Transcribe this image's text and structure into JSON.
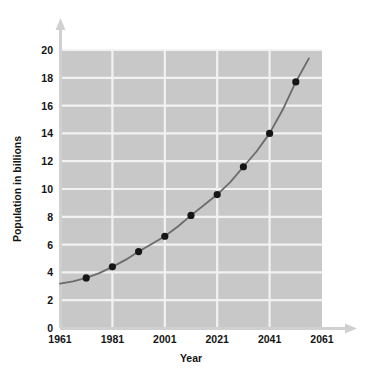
{
  "figure": {
    "corner_mark": "",
    "plot_background_color": "#c8c8c8",
    "grid_color": "#f2f2f2",
    "axis_color": "#d0d0d0",
    "curve_color": "#6b6b6b",
    "marker_color": "#161616"
  },
  "chart_data": {
    "type": "scatter",
    "title": "",
    "xlabel": "Year",
    "ylabel": "Population in billions",
    "xlim": [
      1961,
      2061
    ],
    "ylim": [
      0,
      20
    ],
    "xticks": [
      1961,
      1981,
      2001,
      2021,
      2041,
      2061
    ],
    "xtick_labels": [
      "1961",
      "1981",
      "2001",
      "2021",
      "2041",
      "2061"
    ],
    "yticks": [
      0,
      2,
      4,
      6,
      8,
      10,
      12,
      14,
      16,
      18,
      20
    ],
    "ytick_labels": [
      "0",
      "2",
      "4",
      "6",
      "8",
      "10",
      "12",
      "14",
      "16",
      "18",
      "20"
    ],
    "grid": true,
    "grid_x_values": [
      1981,
      2001,
      2021,
      2041
    ],
    "grid_y_values": [
      2,
      4,
      6,
      8,
      10,
      12,
      14,
      16,
      18,
      20
    ],
    "legend": null,
    "x": [
      1971,
      1981,
      1991,
      2001,
      2011,
      2021,
      2031,
      2041,
      2051
    ],
    "values": [
      3.6,
      4.4,
      5.5,
      6.6,
      8.1,
      9.6,
      11.6,
      14.0,
      17.7
    ],
    "series": [
      {
        "name": "Population in billions",
        "x": [
          1971,
          1981,
          1991,
          2001,
          2011,
          2021,
          2031,
          2041,
          2051
        ],
        "values": [
          3.6,
          4.4,
          5.5,
          6.6,
          8.1,
          9.6,
          11.6,
          14.0,
          17.7
        ],
        "marker": "circle",
        "line": "smooth-fit"
      }
    ],
    "fit_curve_x": [
      1961,
      1966,
      1971,
      1976,
      1981,
      1986,
      1991,
      1996,
      2001,
      2006,
      2011,
      2016,
      2021,
      2026,
      2031,
      2036,
      2041,
      2046,
      2051,
      2056
    ],
    "fit_curve_values": [
      3.2,
      3.35,
      3.6,
      3.95,
      4.4,
      4.9,
      5.5,
      6.05,
      6.6,
      7.3,
      8.1,
      8.85,
      9.6,
      10.5,
      11.6,
      12.7,
      14.0,
      15.7,
      17.7,
      19.4
    ]
  }
}
